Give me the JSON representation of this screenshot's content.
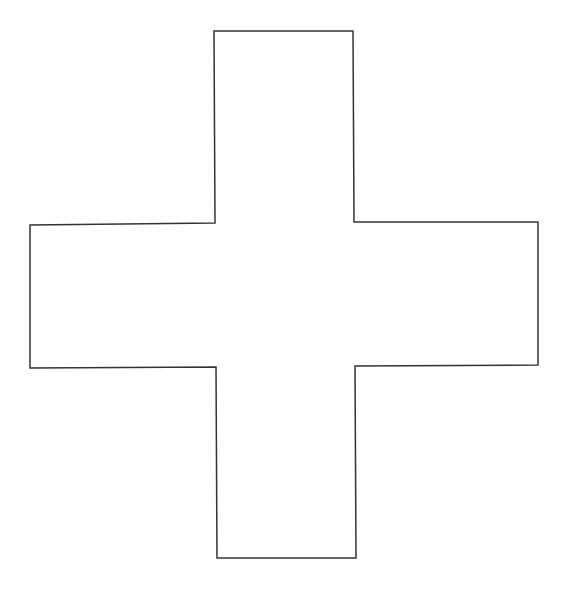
{
  "diagram": {
    "shape": "cross",
    "stroke_color": "#333333",
    "fill_color": "#ffffff",
    "background": "#ffffff",
    "points": "214,31 353,31 354,222 538,222 538,365 355,366 356,558 217,558 216,367 30,368 30,225 215,223"
  }
}
